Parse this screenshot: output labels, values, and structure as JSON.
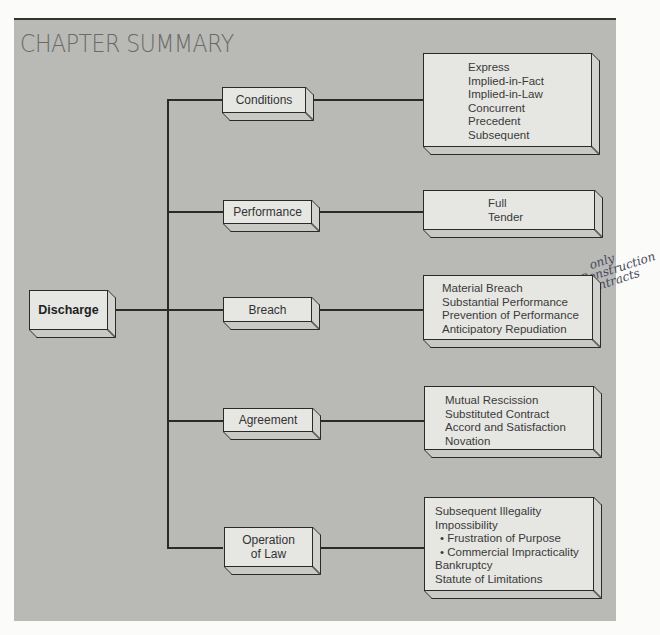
{
  "title": "CHAPTER SUMMARY",
  "root": {
    "label": "Discharge"
  },
  "branches": [
    {
      "label": "Conditions",
      "items": [
        "Express",
        "Implied-in-Fact",
        "Implied-in-Law",
        "Concurrent",
        "Precedent",
        "Subsequent"
      ]
    },
    {
      "label": "Performance",
      "items": [
        "Full",
        "Tender"
      ]
    },
    {
      "label": "Breach",
      "items": [
        "Material Breach",
        "Substantial Performance",
        "Prevention of Performance",
        "Anticipatory Repudiation"
      ]
    },
    {
      "label": "Agreement",
      "items": [
        "Mutual Rescission",
        "Substituted Contract",
        "Accord and Satisfaction",
        "Novation"
      ]
    },
    {
      "label_line1": "Operation",
      "label_line2": "of Law",
      "items": [
        "Subsequent Illegality",
        "Impossibility",
        "• Frustration of Purpose",
        "• Commercial Impracticality",
        "Bankruptcy",
        "Statute of Limitations"
      ]
    }
  ],
  "annotation": {
    "line1": "only",
    "line2": "Construction",
    "line3": "contracts"
  },
  "colors": {
    "panel": "#b9b9b6",
    "box_face": "#e6e6e3",
    "line": "#2a2a2a",
    "title": "#6a6a68"
  }
}
